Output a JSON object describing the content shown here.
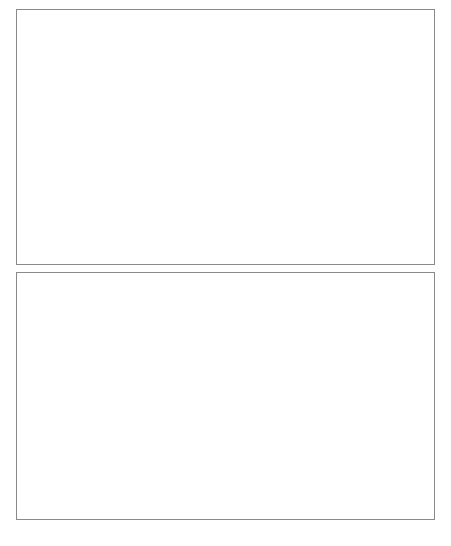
{
  "figure": {
    "caption": "Figure 4.5  Revenue 1990-2006 (in percent of ...)"
  },
  "chart_data": [
    {
      "type": "line",
      "panel": "top",
      "title": "",
      "xlabel": "",
      "ylabel": "",
      "grid": false,
      "legend_position": "upper-center",
      "xlim": [
        1990,
        2006
      ],
      "ylim": [
        0,
        100
      ],
      "ytick_labels": [
        "0",
        "20",
        "40",
        "60",
        "80",
        "100"
      ],
      "yticks": [
        0,
        20,
        40,
        60,
        80,
        100
      ],
      "xtick_labels": [
        "1990",
        "1992",
        "1994",
        "1996",
        "1998",
        "2000",
        "2002",
        "2004",
        "2006"
      ],
      "xticks": [
        1990,
        1992,
        1994,
        1996,
        1998,
        2000,
        2002,
        2004,
        2006
      ],
      "x": [
        1990,
        1991,
        1992,
        1993,
        1994,
        1995,
        1996,
        1997,
        1998,
        1999,
        2000,
        2001,
        2002,
        2003,
        2004,
        2005,
        2006
      ],
      "series": [
        {
          "name": "Emerging Asia excl. China",
          "style": "solid-thin",
          "color": "#333333",
          "values": [
            19.6,
            19.7,
            20.4,
            18.2,
            19.8,
            19.2,
            19.0,
            18.7,
            22.6,
            22.0,
            23.6,
            26.4,
            29.8,
            32.6,
            33.8,
            33.3,
            27.8
          ]
        },
        {
          "name": "China",
          "style": "dashed",
          "color": "#444444",
          "values": [
            42.8,
            56.2,
            20.6,
            16.0,
            30.8,
            34.2,
            38.4,
            43.8,
            42.2,
            41.2,
            41.8,
            46.0,
            58.0,
            66.0,
            83.0,
            94.8,
            95.2
          ]
        },
        {
          "name": "Latin America",
          "style": "solid-thick",
          "color": "#000000",
          "values": [
            8.8,
            10.6,
            13.6,
            14.7,
            12.6,
            14.2,
            15.2,
            13.8,
            11.8,
            10.0,
            10.8,
            10.6,
            11.6,
            12.6,
            13.2,
            13.8,
            14.6
          ]
        },
        {
          "name": "Other Em. Markets",
          "style": "dotted",
          "color": "#8d8d8d",
          "values": [
            15.4,
            16.4,
            17.4,
            17.6,
            18.2,
            18.6,
            19.8,
            20.6,
            18.6,
            18.2,
            19.6,
            21.6,
            24.0,
            26.2,
            29.8,
            34.2,
            37.8
          ]
        }
      ]
    },
    {
      "type": "line",
      "panel": "bottom",
      "title": "",
      "xlabel": "",
      "ylabel": "",
      "grid": false,
      "legend_position": "upper-center",
      "xlim": [
        1990,
        2006
      ],
      "ylim": [
        0,
        70
      ],
      "ytick_labels": [
        "0",
        "10",
        "20",
        "30",
        "40",
        "50",
        "60",
        "70"
      ],
      "yticks": [
        0,
        10,
        20,
        30,
        40,
        50,
        60,
        70
      ],
      "xtick_labels": [
        "1990",
        "1992",
        "1994",
        "1996",
        "1998",
        "2000",
        "2002",
        "2004",
        "2006"
      ],
      "xticks": [
        1990,
        1992,
        1994,
        1996,
        1998,
        2000,
        2002,
        2004,
        2006
      ],
      "x": [
        1990,
        1991,
        1992,
        1993,
        1994,
        1995,
        1996,
        1997,
        1998,
        1999,
        2000,
        2001,
        2002,
        2003,
        2004,
        2005,
        2006
      ],
      "series": [
        {
          "name": "Hong Kong SAR",
          "style": "dotted-thick",
          "color": "#1b1b1b",
          "values": [
            4.2,
            4.4,
            4.8,
            5.0,
            5.2,
            5.6,
            6.0,
            6.4,
            8.4,
            10.4,
            12.6,
            13.4,
            15.0,
            16.2,
            15.4,
            12.6,
            9.2
          ]
        },
        {
          "name": "India",
          "style": "solid-thick",
          "color": "#000000",
          "values": [
            2.2,
            4.6,
            7.6,
            13.2,
            17.0,
            16.4,
            17.2,
            19.8,
            24.2,
            28.4,
            32.0,
            36.2,
            41.6,
            47.4,
            53.2,
            48.8,
            43.8
          ]
        },
        {
          "name": "Indonesia",
          "style": "solid-light",
          "color": "#b9b9b9",
          "values": [
            9.6,
            9.8,
            10.0,
            10.2,
            10.4,
            10.6,
            10.2,
            9.6,
            9.4,
            9.8,
            11.8,
            13.4,
            15.0,
            16.2,
            15.4,
            14.8,
            17.2
          ]
        },
        {
          "name": "Korea",
          "style": "solid-thin",
          "color": "#4a4a4a",
          "values": [
            31.6,
            27.4,
            24.6,
            24.2,
            26.4,
            25.8,
            25.2,
            10.2,
            22.0,
            34.2,
            31.8,
            36.4,
            40.8,
            44.6,
            48.6,
            40.2,
            35.6
          ]
        },
        {
          "name": "Malaysia",
          "style": "dashed-thick",
          "color": "#5a5a5a",
          "values": [
            28.6,
            30.8,
            34.8,
            35.6,
            33.0,
            33.4,
            30.0,
            26.4,
            23.4,
            24.2,
            21.6,
            21.2,
            24.6,
            27.6,
            33.2,
            40.4,
            45.6
          ]
        },
        {
          "name": "Philippines",
          "style": "dash-dot-thin",
          "color": "#7d7d7d",
          "values": [
            4.6,
            6.8,
            8.8,
            9.8,
            10.0,
            9.8,
            10.4,
            10.8,
            12.6,
            15.4,
            18.6,
            20.8,
            22.2,
            22.8,
            23.0,
            22.6,
            21.4
          ]
        },
        {
          "name": "Singapore",
          "style": "dash-dot-light",
          "color": "#c2c2c2",
          "values": [
            43.0,
            46.4,
            48.6,
            49.6,
            50.4,
            49.8,
            48.2,
            43.0,
            32.2,
            24.6,
            20.8,
            19.4,
            18.8,
            19.2,
            21.0,
            22.6,
            23.4
          ]
        },
        {
          "name": "Thailand",
          "style": "dashed-light",
          "color": "#a0a0a0",
          "values": [
            29.4,
            31.2,
            33.0,
            33.6,
            32.0,
            31.4,
            30.0,
            27.0,
            25.4,
            24.8,
            27.4,
            30.4,
            33.2,
            36.2,
            38.0,
            34.4,
            33.2
          ]
        }
      ]
    }
  ]
}
